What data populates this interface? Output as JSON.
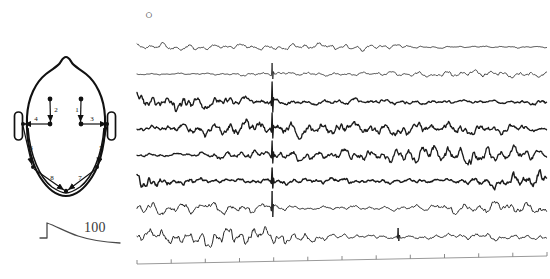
{
  "figure": {
    "panel_marker": "○",
    "panel_marker_icon": "circle-marker-icon",
    "background_color": "#ffffff",
    "trace_color": "#1a1a1a"
  },
  "head_diagram": {
    "name": "head-electrode-montage",
    "outline_color": "#111111",
    "electrode_color": "#111111",
    "electrodes": [
      {
        "id": "e-lf-upper",
        "x": 50,
        "y": 99
      },
      {
        "id": "e-lf-lower",
        "x": 50,
        "y": 124
      },
      {
        "id": "e-rf-upper",
        "x": 81,
        "y": 99
      },
      {
        "id": "e-rf-lower",
        "x": 81,
        "y": 124
      },
      {
        "id": "e-left-temporal",
        "x": 23,
        "y": 124
      },
      {
        "id": "e-right-temporal",
        "x": 107,
        "y": 124
      },
      {
        "id": "e-left-posterior",
        "x": 33,
        "y": 167
      },
      {
        "id": "e-right-posterior",
        "x": 97,
        "y": 167
      },
      {
        "id": "e-occipital",
        "x": 66,
        "y": 191
      }
    ],
    "channel_labels": [
      {
        "id": "ch-1",
        "label": "1",
        "x": 77,
        "y": 112
      },
      {
        "id": "ch-2",
        "label": "2",
        "x": 56,
        "y": 112
      },
      {
        "id": "ch-3",
        "label": "3",
        "x": 92,
        "y": 121
      },
      {
        "id": "ch-4",
        "label": "4",
        "x": 36,
        "y": 121
      },
      {
        "id": "ch-5",
        "label": "5",
        "x": 101,
        "y": 150
      },
      {
        "id": "ch-6",
        "label": "6",
        "x": 31,
        "y": 150
      },
      {
        "id": "ch-7",
        "label": "7",
        "x": 80,
        "y": 180
      },
      {
        "id": "ch-8",
        "label": "8",
        "x": 52,
        "y": 180
      }
    ]
  },
  "calibration": {
    "name": "calibration-scale",
    "value_label": "100",
    "marker_x": 88,
    "marker_y": 228
  },
  "chart_data": {
    "type": "line",
    "title": "",
    "xlabel": "",
    "ylabel": "",
    "legend_position": "none",
    "grid": false,
    "x_range": [
      0,
      400
    ],
    "plot_area": {
      "left": 137,
      "top": 32,
      "width": 410,
      "height": 226
    },
    "timeline": {
      "name": "time-axis",
      "y_left": 264,
      "y_right": 256,
      "tick_count": 13,
      "tick_height": 4,
      "tick_labels": []
    },
    "channels": [
      {
        "name": "ch1-trace",
        "label": "1",
        "baseline": 47,
        "amplitude": 3.1,
        "thickness": 0.8,
        "seed": 11,
        "roughness": 0.55,
        "spike": null
      },
      {
        "name": "ch2-trace",
        "label": "2",
        "baseline": 74,
        "amplitude": 2.8,
        "thickness": 0.8,
        "seed": 27,
        "roughness": 0.5,
        "spike": {
          "x": 272,
          "up": 11,
          "down": 5
        }
      },
      {
        "name": "ch3-trace",
        "label": "3",
        "baseline": 102,
        "amplitude": 6.0,
        "thickness": 1.35,
        "seed": 43,
        "roughness": 0.75,
        "spike": {
          "x": 272,
          "up": 20,
          "down": 10
        }
      },
      {
        "name": "ch4-trace",
        "label": "4",
        "baseline": 129,
        "amplitude": 6.4,
        "thickness": 1.35,
        "seed": 61,
        "roughness": 0.8,
        "spike": {
          "x": 272,
          "up": 16,
          "down": 9
        }
      },
      {
        "name": "ch5-trace",
        "label": "5",
        "baseline": 155,
        "amplitude": 6.2,
        "thickness": 1.3,
        "seed": 83,
        "roughness": 0.82,
        "spike": {
          "x": 272,
          "up": 14,
          "down": 8
        }
      },
      {
        "name": "ch6-trace",
        "label": "6",
        "baseline": 181,
        "amplitude": 6.5,
        "thickness": 1.45,
        "seed": 101,
        "roughness": 0.85,
        "spike": {
          "x": 272,
          "up": 13,
          "down": 7
        }
      },
      {
        "name": "ch7-trace",
        "label": "7",
        "baseline": 208,
        "amplitude": 7.5,
        "thickness": 0.95,
        "seed": 127,
        "roughness": 0.62,
        "spike": {
          "x": 272,
          "up": 17,
          "down": 9
        }
      },
      {
        "name": "ch8-trace",
        "label": "8",
        "baseline": 237,
        "amplitude": 7.0,
        "thickness": 0.95,
        "seed": 149,
        "roughness": 0.6,
        "spike": {
          "x": 398,
          "up": 9,
          "down": 4
        }
      }
    ],
    "secondary_spike_x": 398
  }
}
